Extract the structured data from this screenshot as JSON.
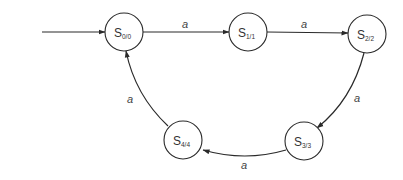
{
  "diagram": {
    "type": "state-machine",
    "colors": {
      "stroke": "#2a2a2a",
      "text": "#333333",
      "background": "#ffffff"
    },
    "start_arrow": {
      "target": "S0/0"
    },
    "states": [
      {
        "id": "S0/0",
        "main": "S",
        "sub": "0/0"
      },
      {
        "id": "S1/1",
        "main": "S",
        "sub": "1/1"
      },
      {
        "id": "S2/2",
        "main": "S",
        "sub": "2/2"
      },
      {
        "id": "S3/3",
        "main": "S",
        "sub": "3/3"
      },
      {
        "id": "S4/4",
        "main": "S",
        "sub": "4/4"
      }
    ],
    "transitions": [
      {
        "from": "S0/0",
        "to": "S1/1",
        "label": "a"
      },
      {
        "from": "S1/1",
        "to": "S2/2",
        "label": "a"
      },
      {
        "from": "S2/2",
        "to": "S3/3",
        "label": "a"
      },
      {
        "from": "S3/3",
        "to": "S4/4",
        "label": "a"
      },
      {
        "from": "S4/4",
        "to": "S0/0",
        "label": "a"
      }
    ]
  }
}
